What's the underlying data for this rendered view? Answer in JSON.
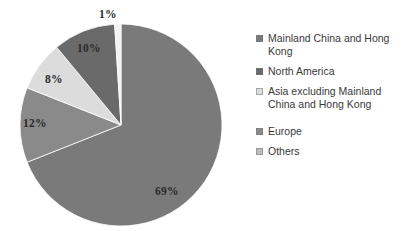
{
  "chart_data": {
    "type": "pie",
    "title": "",
    "categories": [
      "Mainland China and Hong Kong",
      "North America",
      "Asia excluding Mainland China and Hong Kong",
      "Europe",
      "Others"
    ],
    "values": [
      69,
      10,
      8,
      12,
      1
    ],
    "value_labels": [
      "69%",
      "10%",
      "8%",
      "12%",
      "1%"
    ],
    "units": "percent",
    "total": 100,
    "legend_position": "right",
    "grid": false,
    "start_angle_deg": 0,
    "direction": "clockwise",
    "colors": [
      "#7a7a7a",
      "#6a6a6a",
      "#dcdcdc",
      "#8a8a8a",
      "#f2f2f2"
    ]
  },
  "pie": {
    "center_x": 121,
    "center_y": 125,
    "radius": 101,
    "slices": [
      {
        "name": "mainland-china-hong-kong",
        "percent": 69,
        "label": "69%",
        "color": "#7a7a7a",
        "start_deg": 0,
        "end_deg": 248.4
      },
      {
        "name": "europe",
        "percent": 12,
        "label": "12%",
        "color": "#8a8a8a",
        "start_deg": 248.4,
        "end_deg": 291.6
      },
      {
        "name": "asia-excluding-china",
        "percent": 8,
        "label": "8%",
        "color": "#dcdcdc",
        "start_deg": 291.6,
        "end_deg": 320.4
      },
      {
        "name": "north-america",
        "percent": 10,
        "label": "10%",
        "color": "#6a6a6a",
        "start_deg": 320.4,
        "end_deg": 356.4
      },
      {
        "name": "others",
        "percent": 1,
        "label": "1%",
        "color": "#f2f2f2",
        "start_deg": 356.4,
        "end_deg": 360
      }
    ]
  },
  "legend": {
    "items": [
      {
        "label": "Mainland China and Hong Kong",
        "color": "#7a7a7a"
      },
      {
        "label": "North America",
        "color": "#6a6a6a"
      },
      {
        "label": "Asia excluding Mainland China and Hong Kong",
        "color": "#dcdcdc"
      },
      {
        "label": "Europe",
        "color": "#8a8a8a"
      },
      {
        "label": "Others",
        "color": "#bdbdbd"
      }
    ]
  }
}
